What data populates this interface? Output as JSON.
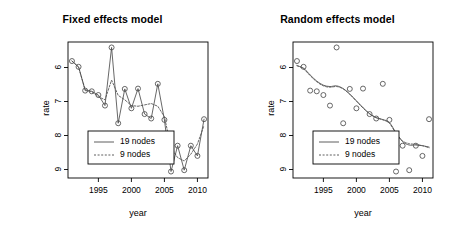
{
  "chart_data": [
    {
      "type": "line",
      "title": "Fixed effects model",
      "xlabel": "year",
      "ylabel": "rate",
      "xlim": [
        1990.4,
        2011.6
      ],
      "ylim": [
        5.75,
        9.75
      ],
      "xticks": [
        1995,
        2000,
        2005,
        2010
      ],
      "yticks": [
        6,
        7,
        8,
        9
      ],
      "grid": false,
      "legend_position": "bottom-left",
      "x": [
        1991,
        1992,
        1993,
        1994,
        1995,
        1996,
        1997,
        1998,
        1999,
        2000,
        2001,
        2002,
        2003,
        2004,
        2005,
        2006,
        2007,
        2008,
        2009,
        2010,
        2011
      ],
      "series": [
        {
          "name": "19 nodes",
          "style": "solid",
          "marker": "open-circle",
          "values": [
            9.19,
            9.02,
            8.32,
            8.3,
            8.19,
            7.88,
            9.59,
            7.36,
            8.37,
            7.8,
            8.38,
            7.63,
            7.5,
            8.52,
            7.46,
            5.94,
            6.7,
            5.98,
            6.7,
            6.4,
            7.48
          ]
        },
        {
          "name": "9 nodes",
          "style": "dashed",
          "marker": "none",
          "values": [
            9.19,
            9.01,
            8.35,
            8.29,
            8.14,
            8.05,
            8.63,
            8.18,
            8.05,
            7.88,
            7.86,
            7.9,
            7.94,
            7.86,
            7.55,
            6.65,
            6.35,
            6.25,
            6.45,
            6.75,
            7.3
          ]
        }
      ]
    },
    {
      "type": "line",
      "title": "Random effects model",
      "xlabel": "year",
      "ylabel": "rate",
      "xlim": [
        1990.4,
        2011.6
      ],
      "ylim": [
        5.75,
        9.75
      ],
      "xticks": [
        1995,
        2000,
        2005,
        2010
      ],
      "yticks": [
        6,
        7,
        8,
        9
      ],
      "grid": false,
      "legend_position": "bottom-left",
      "x": [
        1991,
        1992,
        1993,
        1994,
        1995,
        1996,
        1997,
        1998,
        1999,
        2000,
        2001,
        2002,
        2003,
        2004,
        2005,
        2006,
        2007,
        2008,
        2009,
        2010,
        2011
      ],
      "series": [
        {
          "name": "observed",
          "style": "none",
          "marker": "open-circle",
          "values": [
            9.19,
            9.02,
            8.32,
            8.3,
            8.19,
            7.88,
            9.59,
            7.36,
            8.37,
            7.8,
            8.38,
            7.63,
            7.5,
            8.52,
            7.46,
            5.94,
            6.7,
            5.98,
            6.7,
            6.4,
            7.48
          ]
        },
        {
          "name": "19 nodes",
          "style": "solid",
          "marker": "none",
          "values": [
            9.05,
            8.98,
            8.78,
            8.6,
            8.48,
            8.44,
            8.46,
            8.38,
            8.22,
            8.02,
            7.82,
            7.64,
            7.52,
            7.47,
            7.38,
            7.08,
            6.82,
            6.72,
            6.72,
            6.7,
            6.66
          ]
        },
        {
          "name": "9 nodes",
          "style": "dashed",
          "marker": "none",
          "values": [
            9.06,
            8.96,
            8.76,
            8.58,
            8.46,
            8.42,
            8.44,
            8.37,
            8.21,
            8.01,
            7.81,
            7.64,
            7.53,
            7.46,
            7.36,
            7.06,
            6.84,
            6.76,
            6.74,
            6.7,
            6.64
          ]
        }
      ]
    }
  ],
  "panels": [
    {
      "title": "Fixed effects model",
      "ylabel": "rate",
      "xlabel": "year",
      "ytick_labels": [
        "9",
        "8",
        "7",
        "6"
      ],
      "xtick_labels": [
        "1995",
        "2000",
        "2005",
        "2010"
      ],
      "legend": [
        {
          "label": "19 nodes",
          "style": "solid"
        },
        {
          "label": "9 nodes",
          "style": "dashed"
        }
      ]
    },
    {
      "title": "Random effects model",
      "ylabel": "rate",
      "xlabel": "year",
      "ytick_labels": [
        "9",
        "8",
        "7",
        "6"
      ],
      "xtick_labels": [
        "1995",
        "2000",
        "2005",
        "2010"
      ],
      "legend": [
        {
          "label": "19 nodes",
          "style": "solid"
        },
        {
          "label": "9 nodes",
          "style": "dashed"
        }
      ]
    }
  ],
  "colors": {
    "foreground": "#000000",
    "background": "#ffffff",
    "line": "#4d4d4d",
    "marker": "#4d4d4d"
  }
}
